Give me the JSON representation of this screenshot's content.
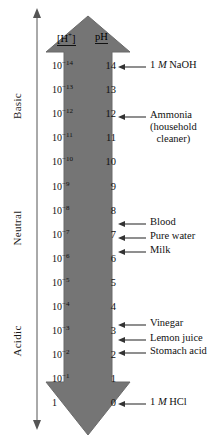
{
  "diagram": {
    "arrow_color": "#757575",
    "arrow_outline": "#5e5e5e",
    "text_color": "#111111"
  },
  "axis": {
    "name": "acidity-basicity-axis",
    "labels": [
      {
        "text": "Basic",
        "name": "axis-label-basic"
      },
      {
        "text": "Neutral",
        "name": "axis-label-neutral"
      },
      {
        "text": "Acidic",
        "name": "axis-label-acidic"
      }
    ]
  },
  "headers": {
    "concentration": "[H+]",
    "ph": "pH"
  },
  "chart_data": {
    "type": "table",
    "categories": [
      "14",
      "13",
      "12",
      "11",
      "10",
      "9",
      "8",
      "7",
      "6",
      "5",
      "4",
      "3",
      "2",
      "1",
      "0"
    ],
    "columns": [
      "[H+]",
      "pH"
    ],
    "rows": [
      {
        "conc_base": "10",
        "conc_exp": "-14",
        "ph": "14"
      },
      {
        "conc_base": "10",
        "conc_exp": "-13",
        "ph": "13"
      },
      {
        "conc_base": "10",
        "conc_exp": "-12",
        "ph": "12"
      },
      {
        "conc_base": "10",
        "conc_exp": "-11",
        "ph": "11"
      },
      {
        "conc_base": "10",
        "conc_exp": "-10",
        "ph": "10"
      },
      {
        "conc_base": "10",
        "conc_exp": "-9",
        "ph": "9"
      },
      {
        "conc_base": "10",
        "conc_exp": "-8",
        "ph": "8"
      },
      {
        "conc_base": "10",
        "conc_exp": "-7",
        "ph": "7"
      },
      {
        "conc_base": "10",
        "conc_exp": "-6",
        "ph": "6"
      },
      {
        "conc_base": "10",
        "conc_exp": "-5",
        "ph": "5"
      },
      {
        "conc_base": "10",
        "conc_exp": "-4",
        "ph": "4"
      },
      {
        "conc_base": "10",
        "conc_exp": "-3",
        "ph": "3"
      },
      {
        "conc_base": "10",
        "conc_exp": "-2",
        "ph": "2"
      },
      {
        "conc_base": "10",
        "conc_exp": "-1",
        "ph": "1"
      },
      {
        "conc_base": "1",
        "conc_exp": "",
        "ph": "0"
      }
    ],
    "annotations": [
      {
        "label": "1 M NaOH",
        "pre": "1 ",
        "em": "M",
        "post": " NaOH",
        "ph": 14
      },
      {
        "label": "Ammonia (household cleaner)",
        "pre": "Ammonia",
        "em": "",
        "post": "",
        "ph": 12,
        "line2": "(household",
        "line3": "cleaner)"
      },
      {
        "label": "Blood",
        "pre": "Blood",
        "em": "",
        "post": "",
        "ph": 7.8
      },
      {
        "label": "Pure water",
        "pre": "Pure water",
        "em": "",
        "post": "",
        "ph": 7
      },
      {
        "label": "Milk",
        "pre": "Milk",
        "em": "",
        "post": "",
        "ph": 6.4
      },
      {
        "label": "Vinegar",
        "pre": "Vinegar",
        "em": "",
        "post": "",
        "ph": 3
      },
      {
        "label": "Lemon juice",
        "pre": "Lemon juice",
        "em": "",
        "post": "",
        "ph": 2.4
      },
      {
        "label": "Stomach acid",
        "pre": "Stomach acid",
        "em": "",
        "post": "",
        "ph": 1.9
      },
      {
        "label": "1 M HCl",
        "pre": "1 ",
        "em": "M",
        "post": " HCl",
        "ph": 0
      }
    ],
    "ylabel": "pH",
    "xlabel": "",
    "grid": false,
    "legend": "none"
  },
  "callouts": [
    {
      "name": "callout-naoh",
      "top": 61,
      "line1": "1 ",
      "italic": "M",
      "line1b": " NaOH",
      "line2": "",
      "line3": ""
    },
    {
      "name": "callout-ammonia",
      "top": 111,
      "line1": "Ammonia",
      "italic": "",
      "line1b": "",
      "line2": "(household",
      "line3": "cleaner)"
    },
    {
      "name": "callout-blood",
      "top": 218,
      "line1": "Blood",
      "italic": "",
      "line1b": "",
      "line2": "",
      "line3": ""
    },
    {
      "name": "callout-pure-water",
      "top": 232,
      "line1": "Pure water",
      "italic": "",
      "line1b": "",
      "line2": "",
      "line3": ""
    },
    {
      "name": "callout-milk",
      "top": 246,
      "line1": "Milk",
      "italic": "",
      "line1b": "",
      "line2": "",
      "line3": ""
    },
    {
      "name": "callout-vinegar",
      "top": 319,
      "line1": "Vinegar",
      "italic": "",
      "line1b": "",
      "line2": "",
      "line3": ""
    },
    {
      "name": "callout-lemon-juice",
      "top": 334,
      "line1": "Lemon juice",
      "italic": "",
      "line1b": "",
      "line2": "",
      "line3": ""
    },
    {
      "name": "callout-stomach-acid",
      "top": 347,
      "line1": "Stomach acid",
      "italic": "",
      "line1b": "",
      "line2": "",
      "line3": ""
    },
    {
      "name": "callout-hcl",
      "top": 398,
      "line1": "1 ",
      "italic": "M",
      "line1b": " HCl",
      "line2": "",
      "line3": ""
    }
  ]
}
